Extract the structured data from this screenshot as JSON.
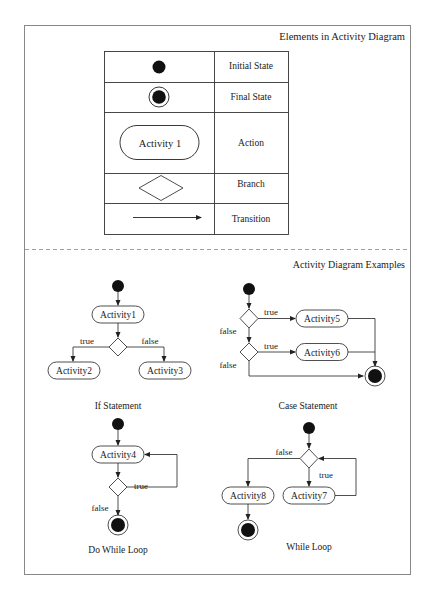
{
  "elements_section": {
    "title": "Elements in Activity Diagram",
    "rows": [
      {
        "symbol": "initial-state-icon",
        "label": "Initial State"
      },
      {
        "symbol": "final-state-icon",
        "label": "Final State"
      },
      {
        "symbol": "action-node",
        "symbol_text": "Activity 1",
        "label": "Action"
      },
      {
        "symbol": "branch-diamond-icon",
        "label": "Branch"
      },
      {
        "symbol": "transition-arrow-icon",
        "label": "Transition"
      }
    ]
  },
  "examples_section": {
    "title": "Activity Diagram Examples",
    "if_statement": {
      "caption": "If Statement",
      "activities": [
        "Activity1",
        "Activity2",
        "Activity3"
      ],
      "true_label": "true",
      "false_label": "false"
    },
    "case_statement": {
      "caption": "Case Statement",
      "activities": [
        "Activity5",
        "Activity6"
      ],
      "true_label_1": "true",
      "false_label_1": "false",
      "true_label_2": "true",
      "false_label_2": "false"
    },
    "do_while_loop": {
      "caption": "Do While Loop",
      "activities": [
        "Activity4"
      ],
      "true_label": "true",
      "false_label": "false"
    },
    "while_loop": {
      "caption": "While Loop",
      "activities": [
        "Activity8",
        "Activity7"
      ],
      "true_label": "true",
      "false_label": "false"
    }
  },
  "colors": {
    "line": "#333333",
    "fill": "#111111",
    "frame": "#777777"
  }
}
